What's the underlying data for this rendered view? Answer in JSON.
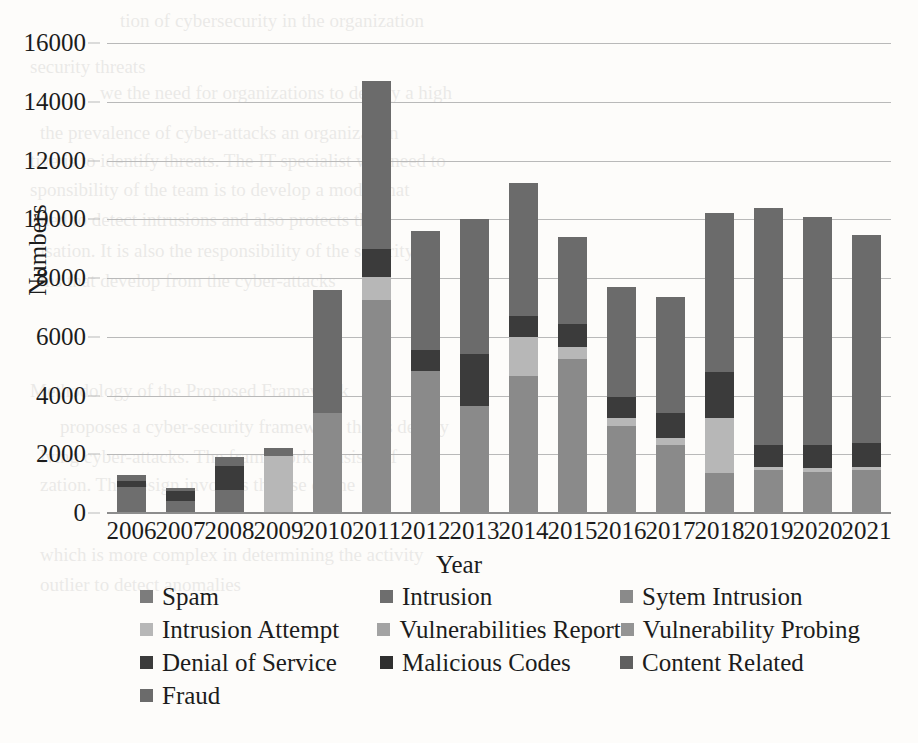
{
  "chart_data": {
    "type": "bar",
    "subtype": "stacked-bar",
    "title": "",
    "xlabel": "Year",
    "ylabel": "Numbers",
    "ylim": [
      0,
      16000
    ],
    "ytick_step": 2000,
    "yticks": [
      "0",
      "2000",
      "4000",
      "6000",
      "8000",
      "10000",
      "12000",
      "14000",
      "16000"
    ],
    "grid": true,
    "legend_position": "bottom",
    "categories": [
      "2006",
      "2007",
      "2008",
      "2009",
      "2010",
      "2011",
      "2012",
      "2013",
      "2014",
      "2015",
      "2016",
      "2017",
      "2018",
      "2019",
      "2020",
      "2021"
    ],
    "series": [
      {
        "name": "Spam",
        "color": "#7c7c7c",
        "values": [
          0,
          0,
          0,
          0,
          0,
          0,
          0,
          0,
          0,
          0,
          0,
          0,
          0,
          0,
          0,
          0
        ]
      },
      {
        "name": "Intrusion",
        "color": "#6e6e6e",
        "values": [
          900,
          400,
          800,
          0,
          0,
          0,
          0,
          0,
          0,
          0,
          0,
          0,
          0,
          0,
          0,
          0
        ]
      },
      {
        "name": "Sytem Intrusion",
        "color": "#8a8a8a",
        "values": [
          0,
          0,
          0,
          0,
          3400,
          7250,
          4850,
          3650,
          4650,
          5250,
          2950,
          2300,
          1350,
          1450,
          1400,
          1450
        ]
      },
      {
        "name": "Intrusion Attempt",
        "color": "#b7b7b7",
        "values": [
          0,
          0,
          0,
          1950,
          0,
          800,
          0,
          0,
          1350,
          400,
          300,
          250,
          1900,
          100,
          120,
          120
        ]
      },
      {
        "name": "Vulnerabilities Report",
        "color": "#a3a3a3",
        "values": [
          0,
          0,
          0,
          0,
          0,
          0,
          0,
          0,
          0,
          0,
          0,
          0,
          0,
          0,
          0,
          0
        ]
      },
      {
        "name": "Vulnerability Probing",
        "color": "#949494",
        "values": [
          0,
          0,
          0,
          0,
          0,
          0,
          0,
          0,
          0,
          0,
          0,
          0,
          0,
          0,
          0,
          0
        ]
      },
      {
        "name": "Denial of Service",
        "color": "#3b3b3b",
        "values": [
          200,
          350,
          800,
          0,
          0,
          950,
          700,
          1750,
          700,
          800,
          700,
          850,
          1550,
          750,
          800,
          800
        ]
      },
      {
        "name": "Malicious Codes",
        "color": "#2f2f2f",
        "values": [
          0,
          0,
          0,
          0,
          0,
          0,
          0,
          0,
          0,
          0,
          0,
          0,
          0,
          0,
          0,
          0
        ]
      },
      {
        "name": "Content Related",
        "color": "#5f5f5f",
        "values": [
          0,
          0,
          0,
          0,
          0,
          0,
          0,
          0,
          0,
          0,
          0,
          0,
          0,
          0,
          0,
          0
        ]
      },
      {
        "name": "Fraud",
        "color": "#6b6b6b",
        "values": [
          200,
          100,
          300,
          250,
          4200,
          5700,
          4050,
          4600,
          4550,
          2950,
          3750,
          3950,
          5400,
          8100,
          7750,
          7100
        ]
      }
    ],
    "totals": [
      1300,
      850,
      1900,
      2200,
      7600,
      14700,
      9600,
      10000,
      11250,
      9400,
      7700,
      7350,
      10200,
      10400,
      10070,
      9470
    ]
  },
  "legend": {
    "rows": [
      [
        "Spam",
        "Intrusion",
        "Sytem Intrusion"
      ],
      [
        "Intrusion Attempt",
        "Vulnerabilities Report",
        "Vulnerability Probing"
      ],
      [
        "Denial of Service",
        "Malicious Codes",
        "Content Related"
      ],
      [
        "Fraud"
      ]
    ]
  },
  "bleed_text": [
    {
      "x": 120,
      "y": 6,
      "t": "tion of cybersecurity in the organization"
    },
    {
      "x": 30,
      "y": 52,
      "t": "security threats"
    },
    {
      "x": 100,
      "y": 78,
      "t": "we the need for organizations to deploy a high"
    },
    {
      "x": 40,
      "y": 118,
      "t": "the prevalence of cyber-attacks an organization"
    },
    {
      "x": 30,
      "y": 146,
      "t": "tive is to identify threats. The IT specialist will need to"
    },
    {
      "x": 30,
      "y": 175,
      "t": "sponsibility of the team is to develop a model that"
    },
    {
      "x": 40,
      "y": 205,
      "t": "ned to detect intrusions and also protects the"
    },
    {
      "x": 40,
      "y": 236,
      "t": "isation. It is also the responsibility of the security"
    },
    {
      "x": 40,
      "y": 266,
      "t": "ms that develop from the cyber-attacks"
    },
    {
      "x": 30,
      "y": 376,
      "t": "Methodology of the Proposed Framework"
    },
    {
      "x": 60,
      "y": 412,
      "t": "proposes a cyber-security framework that is deploy"
    },
    {
      "x": 40,
      "y": 442,
      "t": "lving cyber-attacks. The framework consists of"
    },
    {
      "x": 40,
      "y": 470,
      "t": "zation. The design involves the use of the"
    },
    {
      "x": 40,
      "y": 540,
      "t": "which is more complex in determining the activity"
    },
    {
      "x": 40,
      "y": 570,
      "t": "outlier to detect anomalies"
    }
  ]
}
